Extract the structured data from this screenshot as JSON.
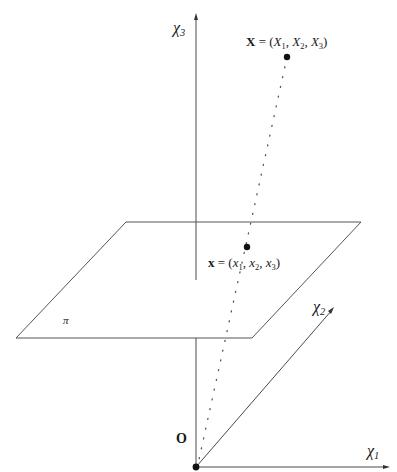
{
  "figure": {
    "axes": {
      "x1": {
        "symbol": "χ",
        "sub": "1"
      },
      "x2": {
        "symbol": "χ",
        "sub": "2"
      },
      "x3": {
        "symbol": "χ",
        "sub": "3"
      }
    },
    "origin_label": "O",
    "plane_label": "π",
    "world_point": {
      "name": "X",
      "eq": " = (",
      "c1": "X",
      "s1": "1",
      "c2": "X",
      "s2": "2",
      "c3": "X",
      "s3": "3",
      "close": ")"
    },
    "image_point": {
      "name": "x",
      "eq": " = (",
      "c1": "x",
      "s1": "1",
      "c2": "x",
      "s2": "2",
      "c3": "x",
      "s3": "3",
      "close": ")"
    },
    "colors": {
      "line": "#4a4a4a",
      "point": "#111111",
      "background": "#ffffff"
    }
  }
}
